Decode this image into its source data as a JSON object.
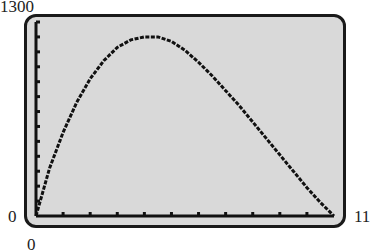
{
  "labels": {
    "ymax": "1300",
    "ymin": "0",
    "xmin": "0",
    "xmax": "11"
  },
  "chart_data": {
    "type": "line",
    "title": "",
    "xlabel": "",
    "ylabel": "",
    "xlim": [
      0,
      11
    ],
    "ylim": [
      0,
      1300
    ],
    "x_tick_step": 1,
    "y_tick_step": 100,
    "grid": false,
    "series": [
      {
        "name": "curve",
        "x": [
          0,
          0.5,
          1,
          1.5,
          2,
          2.5,
          3,
          3.5,
          4,
          4.5,
          5,
          5.5,
          6,
          6.5,
          7,
          7.5,
          8,
          8.5,
          9,
          9.5,
          10,
          10.5,
          11
        ],
        "y": [
          0,
          320,
          560,
          760,
          920,
          1040,
          1130,
          1180,
          1200,
          1200,
          1170,
          1110,
          1030,
          940,
          840,
          740,
          630,
          520,
          410,
          300,
          190,
          90,
          0
        ]
      }
    ]
  },
  "colors": {
    "screen_bg": "#d9d9d9",
    "line": "#111111",
    "frame": "#1a1a1a"
  }
}
